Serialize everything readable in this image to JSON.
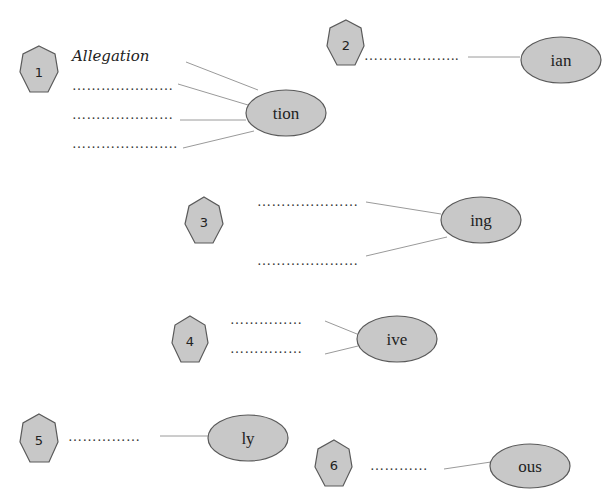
{
  "colors": {
    "shape_fill": "#c8c8c8",
    "shape_stroke": "#5a5a5a",
    "connector": "#9a9a9a",
    "background": "#ffffff"
  },
  "groups": [
    {
      "number": "1",
      "suffix": "tion",
      "example": "Allegation",
      "blanks": [
        "…………………",
        "…………………",
        "…………………."
      ]
    },
    {
      "number": "2",
      "suffix": "ian",
      "blanks": [
        "……………….."
      ]
    },
    {
      "number": "3",
      "suffix": "ing",
      "blanks": [
        "…………………",
        "…………………"
      ]
    },
    {
      "number": "4",
      "suffix": "ive",
      "blanks": [
        "……………",
        "……………"
      ]
    },
    {
      "number": "5",
      "suffix": "ly",
      "blanks": [
        "……………"
      ]
    },
    {
      "number": "6",
      "suffix": "ous",
      "blanks": [
        "…………"
      ]
    }
  ]
}
